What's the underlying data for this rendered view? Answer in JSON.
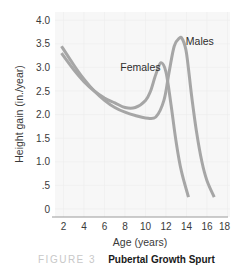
{
  "chart_data": {
    "type": "line",
    "title": "",
    "xlabel": "Age (years)",
    "ylabel": "Height gain (in./year)",
    "xlim": [
      0,
      18
    ],
    "ylim": [
      0,
      4.0
    ],
    "x_ticks": [
      "2",
      "4",
      "6",
      "8",
      "10",
      "12",
      "14",
      "16",
      "18"
    ],
    "y_ticks": [
      "4.0",
      "3.5",
      "3.0",
      "2.5",
      "2.0",
      "1.5",
      "1.0",
      ".5",
      "0"
    ],
    "grid": true,
    "legend": "inline labels",
    "series": [
      {
        "name": "Females",
        "color": "#a6a6a6",
        "x": [
          1.8,
          3,
          4,
          5,
          6,
          7,
          8,
          9,
          10,
          10.5,
          11,
          11.5,
          12,
          12.5,
          13,
          13.5,
          14.2
        ],
        "y": [
          3.3,
          2.95,
          2.7,
          2.5,
          2.35,
          2.25,
          2.15,
          2.15,
          2.3,
          2.5,
          2.85,
          3.1,
          2.9,
          2.2,
          1.4,
          0.8,
          0.25
        ]
      },
      {
        "name": "Males",
        "color": "#a6a6a6",
        "x": [
          1.8,
          3,
          4,
          5,
          6,
          7,
          8,
          9,
          10,
          11,
          11.8,
          12.3,
          12.8,
          13.3,
          13.6,
          14,
          14.5,
          15,
          15.5,
          16,
          16.7
        ],
        "y": [
          3.45,
          3.05,
          2.75,
          2.5,
          2.3,
          2.15,
          2.05,
          1.98,
          1.93,
          1.95,
          2.3,
          2.9,
          3.45,
          3.62,
          3.6,
          3.3,
          2.4,
          1.6,
          1.0,
          0.6,
          0.25
        ]
      }
    ],
    "annotations": [
      {
        "text": "Females",
        "x": 9.5,
        "y": 3.0
      },
      {
        "text": "Males",
        "x": 15.3,
        "y": 3.55
      }
    ]
  },
  "caption": {
    "figure_label": "FIGURE 3",
    "title": "Pubertal Growth Spurt"
  }
}
